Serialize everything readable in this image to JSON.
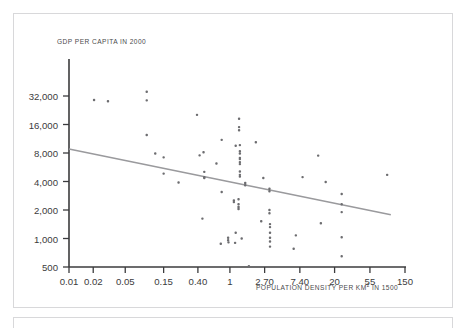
{
  "figure": {
    "background_color": "#ffffff",
    "border_color": "#d8d8da",
    "axis_color": "#3b3b3d",
    "point_color": "#6d6d70",
    "trendline_color": "#9a9a9d"
  },
  "chart_data": {
    "type": "scatter",
    "title": "",
    "xlabel": "POPULATION DENSITY PER KM² IN 1500",
    "ylabel": "GDP PER CAPITA IN 2000",
    "xscale": "log",
    "yscale": "log",
    "xlim": [
      0.01,
      150
    ],
    "ylim": [
      500,
      45255
    ],
    "grid": false,
    "legend": null,
    "xticks": [
      0.01,
      0.02,
      0.05,
      0.15,
      0.4,
      1,
      2.7,
      7.4,
      20,
      55,
      150
    ],
    "xtick_labels": [
      "0.01",
      "0.02",
      "0.05",
      "0.15",
      "0.40",
      "1",
      "2.70",
      "7.40",
      "20",
      "55",
      "150"
    ],
    "yticks": [
      500,
      1000,
      2000,
      4000,
      8000,
      16000,
      32000
    ],
    "ytick_labels": [
      "500",
      "1,000",
      "2,000",
      "4,000",
      "8,000",
      "16,000",
      "32,000"
    ],
    "trendline": {
      "label": "fitted regression line",
      "x_start": 0.01,
      "y_start": 8800,
      "x_end": 100,
      "y_end": 1780
    },
    "points": [
      {
        "x": 0.0205,
        "y": 29000
      },
      {
        "x": 0.0305,
        "y": 28200
      },
      {
        "x": 0.0925,
        "y": 35500
      },
      {
        "x": 0.0925,
        "y": 28800
      },
      {
        "x": 0.0925,
        "y": 12400
      },
      {
        "x": 0.118,
        "y": 7900
      },
      {
        "x": 0.15,
        "y": 7200
      },
      {
        "x": 0.15,
        "y": 4850
      },
      {
        "x": 0.23,
        "y": 3900
      },
      {
        "x": 0.39,
        "y": 20200
      },
      {
        "x": 0.42,
        "y": 7550
      },
      {
        "x": 0.47,
        "y": 8150
      },
      {
        "x": 0.48,
        "y": 5050
      },
      {
        "x": 0.48,
        "y": 4450
      },
      {
        "x": 0.48,
        "y": 4350
      },
      {
        "x": 0.455,
        "y": 1620
      },
      {
        "x": 0.79,
        "y": 11000
      },
      {
        "x": 0.79,
        "y": 3100
      },
      {
        "x": 0.77,
        "y": 880
      },
      {
        "x": 0.68,
        "y": 6200
      },
      {
        "x": 0.95,
        "y": 1020
      },
      {
        "x": 0.95,
        "y": 960
      },
      {
        "x": 0.96,
        "y": 910
      },
      {
        "x": 1.18,
        "y": 9550
      },
      {
        "x": 1.18,
        "y": 1150
      },
      {
        "x": 1.12,
        "y": 2520
      },
      {
        "x": 1.12,
        "y": 2420
      },
      {
        "x": 1.16,
        "y": 900
      },
      {
        "x": 1.3,
        "y": 18400
      },
      {
        "x": 1.3,
        "y": 15000
      },
      {
        "x": 1.3,
        "y": 13900
      },
      {
        "x": 1.33,
        "y": 9700
      },
      {
        "x": 1.33,
        "y": 8350
      },
      {
        "x": 1.33,
        "y": 7900
      },
      {
        "x": 1.33,
        "y": 7100
      },
      {
        "x": 1.33,
        "y": 6900
      },
      {
        "x": 1.33,
        "y": 6400
      },
      {
        "x": 1.33,
        "y": 6100
      },
      {
        "x": 1.33,
        "y": 5100
      },
      {
        "x": 1.33,
        "y": 4700
      },
      {
        "x": 1.33,
        "y": 4500
      },
      {
        "x": 1.28,
        "y": 2600
      },
      {
        "x": 1.28,
        "y": 2300
      },
      {
        "x": 1.28,
        "y": 2150
      },
      {
        "x": 1.28,
        "y": 2050
      },
      {
        "x": 1.4,
        "y": 1000
      },
      {
        "x": 1.55,
        "y": 3850
      },
      {
        "x": 1.55,
        "y": 3650
      },
      {
        "x": 1.72,
        "y": 510
      },
      {
        "x": 2.1,
        "y": 10400
      },
      {
        "x": 2.45,
        "y": 1520
      },
      {
        "x": 2.6,
        "y": 4350
      },
      {
        "x": 3.1,
        "y": 3350
      },
      {
        "x": 3.1,
        "y": 3150
      },
      {
        "x": 3.1,
        "y": 2000
      },
      {
        "x": 3.1,
        "y": 1850
      },
      {
        "x": 3.15,
        "y": 1420
      },
      {
        "x": 3.15,
        "y": 1320
      },
      {
        "x": 3.15,
        "y": 1150
      },
      {
        "x": 3.15,
        "y": 1020
      },
      {
        "x": 3.15,
        "y": 930
      },
      {
        "x": 3.15,
        "y": 820
      },
      {
        "x": 6.2,
        "y": 780
      },
      {
        "x": 6.6,
        "y": 1080
      },
      {
        "x": 8.0,
        "y": 4450
      },
      {
        "x": 12.5,
        "y": 7500
      },
      {
        "x": 13.5,
        "y": 1450
      },
      {
        "x": 15.5,
        "y": 3950
      },
      {
        "x": 24.5,
        "y": 2950
      },
      {
        "x": 24.5,
        "y": 2300
      },
      {
        "x": 24.5,
        "y": 1900
      },
      {
        "x": 24.5,
        "y": 1030
      },
      {
        "x": 24.5,
        "y": 650
      },
      {
        "x": 90.0,
        "y": 4700
      }
    ]
  }
}
